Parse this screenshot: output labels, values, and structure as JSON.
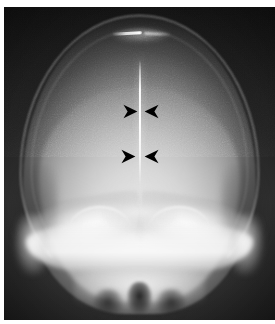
{
  "figure": {
    "kind": "radiograph",
    "modality": "plain-film-x-ray",
    "view": "frontal-ap-skull",
    "caption": "",
    "width_px": 275,
    "height_px": 324
  },
  "plate": {
    "left_px": 4,
    "top_px": 7,
    "width_px": 271,
    "height_px": 313,
    "background_color": "#0a0a0a",
    "margin_color": "#ffffff"
  },
  "anatomy": {
    "regions": [
      {
        "name": "cranial-vault",
        "label": "Cranial vault"
      },
      {
        "name": "calvarial-rim",
        "label": "Calvarial cortical rim"
      },
      {
        "name": "cerebral-field",
        "label": "Cerebral field"
      },
      {
        "name": "sagittal-midline",
        "label": "Sagittal midline density"
      },
      {
        "name": "vertex-density",
        "label": "Vertex linear density"
      },
      {
        "name": "petrous-ridge-left",
        "label": "Left petrous ridge"
      },
      {
        "name": "petrous-ridge-right",
        "label": "Right petrous ridge"
      },
      {
        "name": "orbital-roof-left",
        "label": "Left orbital roof"
      },
      {
        "name": "orbital-roof-right",
        "label": "Right orbital roof"
      },
      {
        "name": "skull-base",
        "label": "Skull base"
      },
      {
        "name": "nasal-cavity",
        "label": "Nasal cavity"
      },
      {
        "name": "maxillary-sinus-left",
        "label": "Left maxillary sinus"
      },
      {
        "name": "maxillary-sinus-right",
        "label": "Right maxillary sinus"
      },
      {
        "name": "temporal-region-left",
        "label": "Left temporal region"
      },
      {
        "name": "temporal-region-right",
        "label": "Right temporal region"
      }
    ]
  },
  "annotations": {
    "marker_color": "#000000",
    "marker_shape": "arrowhead",
    "markers": [
      {
        "id": "upper-left",
        "direction": "right",
        "x_pct": 44.0,
        "y_pct": 31.0,
        "points_to": "sagittal-midline"
      },
      {
        "id": "upper-right",
        "direction": "left",
        "x_pct": 51.5,
        "y_pct": 31.0,
        "points_to": "sagittal-midline"
      },
      {
        "id": "lower-left",
        "direction": "right",
        "x_pct": 43.0,
        "y_pct": 45.5,
        "points_to": "sagittal-midline"
      },
      {
        "id": "lower-right",
        "direction": "left",
        "x_pct": 51.5,
        "y_pct": 45.5,
        "points_to": "sagittal-midline"
      }
    ]
  }
}
